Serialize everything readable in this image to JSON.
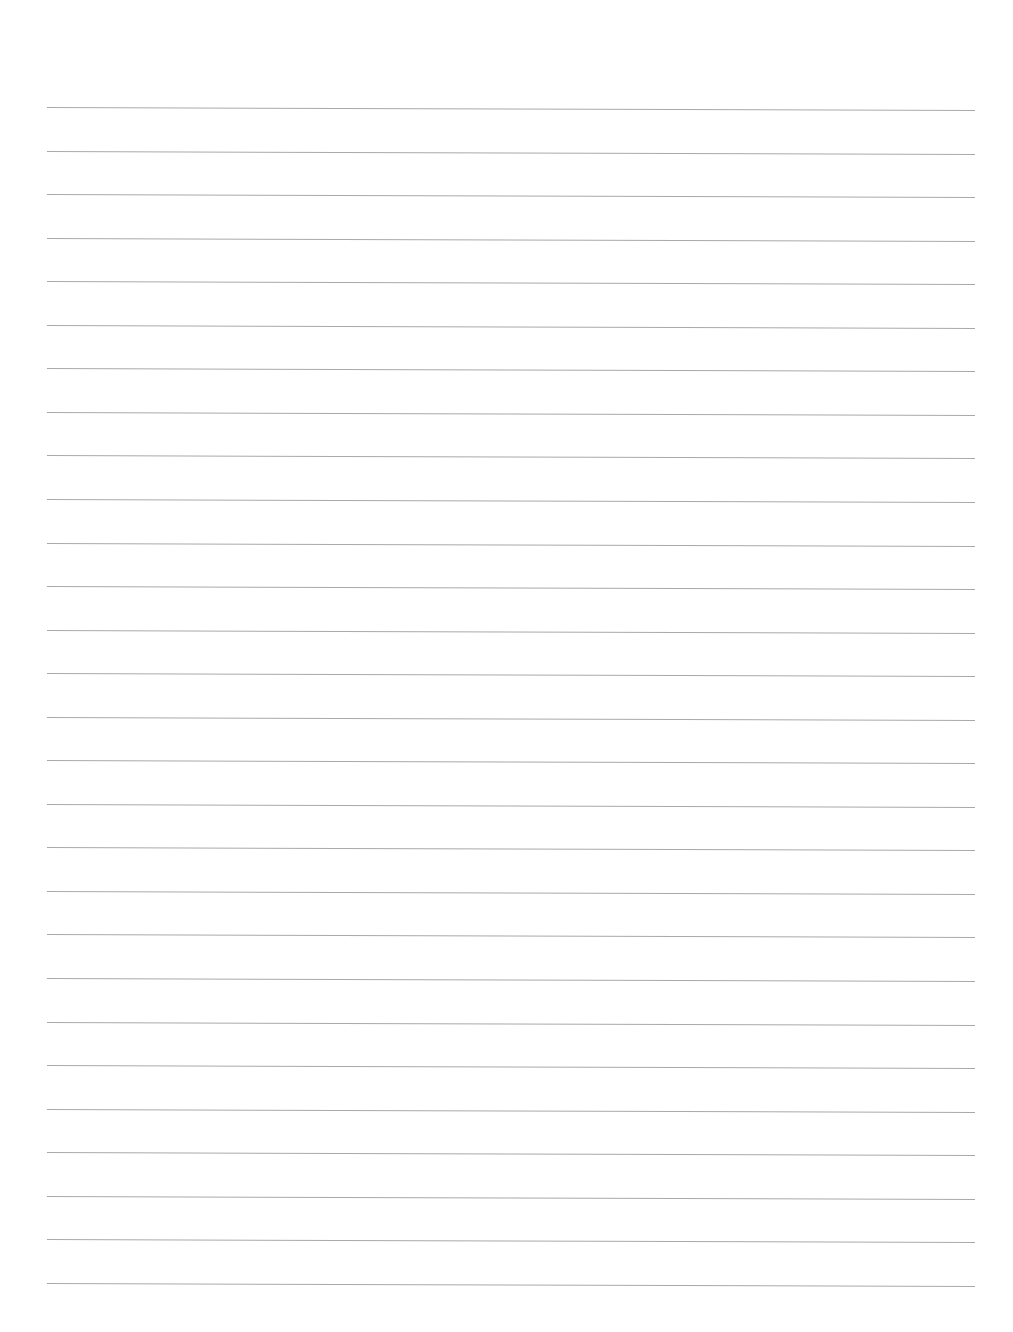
{
  "document": {
    "type": "lined-paper",
    "background_color": "#ffffff",
    "rule_color": "#9a9a9a",
    "rule_count": 28,
    "first_rule_y": 107,
    "rule_spacing": 43.55,
    "rule_left_x": 47,
    "rule_right_x": 975,
    "text": ""
  }
}
